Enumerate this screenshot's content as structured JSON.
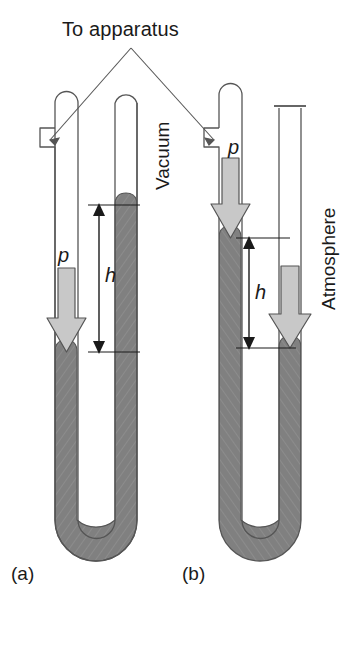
{
  "figure": {
    "type": "scientific-diagram",
    "background_color": "#ffffff",
    "annotations": {
      "to_apparatus": "To apparatus",
      "panel_a": "(a)",
      "panel_b": "(b)"
    },
    "colors": {
      "mercury": "#808080",
      "mercury_edge": "#555555",
      "arrow_fill": "#c8c8c8",
      "arrow_edge": "#555555",
      "tube_outline": "#555555",
      "text": "#1a1a1a"
    },
    "panels": [
      {
        "id": "a",
        "label": "(a)",
        "type": "closed-end-manometer",
        "left_tube": {
          "top": "sealed-rounded",
          "side_arm": true,
          "side_arm_label": "To apparatus",
          "mercury_level_y": 352,
          "pressure_arrow": {
            "label": "p",
            "direction": "down"
          }
        },
        "right_tube": {
          "top": "sealed-rounded",
          "headspace_label": "Vacuum",
          "mercury_level_y": 205
        },
        "height_dimension": {
          "label": "h",
          "from_y": 205,
          "to_y": 352
        }
      },
      {
        "id": "b",
        "label": "(b)",
        "type": "open-end-manometer",
        "left_tube": {
          "top": "sealed-rounded",
          "side_arm": true,
          "side_arm_label": "To apparatus",
          "mercury_level_y": 238,
          "pressure_arrow": {
            "label": "p",
            "direction": "down"
          }
        },
        "right_tube": {
          "top": "open",
          "headspace_label": "Atmosphere",
          "mercury_level_y": 348,
          "pressure_arrow": {
            "label": "Atmosphere",
            "direction": "down"
          }
        },
        "height_dimension": {
          "label": "h",
          "from_y": 238,
          "to_y": 348
        }
      }
    ],
    "labels": {
      "vacuum": "Vacuum",
      "atmosphere": "Atmosphere",
      "p_symbol": "p",
      "h_symbol": "h"
    }
  }
}
